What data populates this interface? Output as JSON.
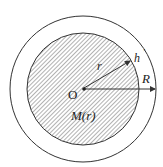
{
  "diagram": {
    "labels": {
      "center": "O",
      "inner_radius": "r",
      "thickness": "h",
      "outer_radius": "R",
      "mass": "M(r)"
    },
    "colors": {
      "stroke": "#333333",
      "hatch": "#555555",
      "background": "#ffffff"
    }
  }
}
